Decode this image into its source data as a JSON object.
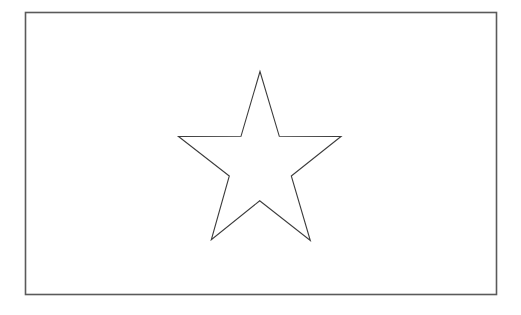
{
  "figure": {
    "background_color": "#ffffff",
    "stroke_color": "#4a4a4a",
    "frame": {
      "shape": "rectangle",
      "x": 25.5,
      "y": 12.5,
      "width": 471,
      "height": 282,
      "stroke_color": "#5a5a5a",
      "stroke_width": 1.6,
      "fill": "#ffffff"
    },
    "star": {
      "shape": "five-pointed-star",
      "fill": "none",
      "stroke_color": "#3c3c3c",
      "stroke_width": 1.1,
      "points": "260,71.5 241,136.3 178.5,136.5 229.3,176 211.3,239.8 259.7,200.8 310.3,240.5 291.3,176 341,136.5 279.3,136.3"
    }
  }
}
